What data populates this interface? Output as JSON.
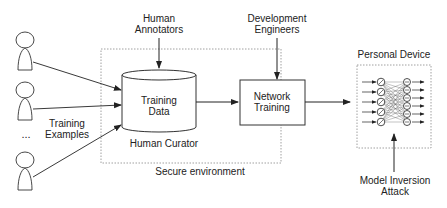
{
  "labels": {
    "human_annotators": [
      "Human",
      "Annotators"
    ],
    "development_engineers": [
      "Development",
      "Engineers"
    ],
    "personal_device": "Personal Device",
    "training_data": [
      "Training",
      "Data"
    ],
    "network_training": [
      "Network",
      "Training"
    ],
    "human_curator": "Human Curator",
    "secure_environment": "Secure environment",
    "training_examples": [
      "Training",
      "Examples"
    ],
    "ellipsis": "...",
    "model_inversion_attack": [
      "Model Inversion",
      "Attack"
    ]
  },
  "colors": {
    "stroke": "#222222",
    "dotted_border": "#888888",
    "background": "#ffffff"
  }
}
